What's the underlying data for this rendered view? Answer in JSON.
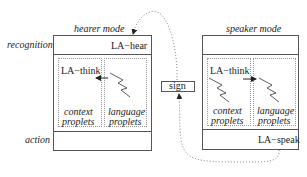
{
  "diagram": {
    "row_labels": {
      "recognition": "recognition",
      "action": "action"
    },
    "hearer": {
      "title": "hearer mode",
      "top_label": "LA−hear",
      "think_label": "LA−think",
      "context": [
        "context",
        "proplets"
      ],
      "language": [
        "language",
        "proplets"
      ],
      "bottom_label": ""
    },
    "speaker": {
      "title": "speaker mode",
      "top_label": "",
      "think_label": "LA−think",
      "context": [
        "context",
        "proplets"
      ],
      "language": [
        "language",
        "proplets"
      ],
      "bottom_label": "LA−speak"
    },
    "sign": "sign",
    "arrows": [
      {
        "from": "speaker-LA-speak",
        "to": "sign",
        "style": "dotted"
      },
      {
        "from": "sign",
        "to": "hearer-LA-hear",
        "style": "dotted"
      },
      {
        "from": "hearer-language-proplets",
        "to": "hearer-context-proplets",
        "style": "solid"
      },
      {
        "from": "speaker-context-proplets",
        "to": "speaker-language-proplets",
        "style": "solid"
      }
    ],
    "colors": {
      "line": "#555555",
      "dotted": "#999999",
      "text": "#222222"
    }
  }
}
